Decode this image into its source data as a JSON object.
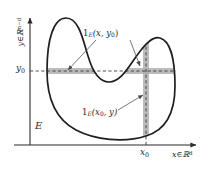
{
  "figure": {
    "domain": "measure-theory-fubini-slices-diagram",
    "background_color": "#ffffff",
    "ink_color": "#2b2b2b",
    "highlight_color": "#9a9a9a",
    "axes": {
      "x_axis_label": "x∈ℝ",
      "x_axis_exponent": "d",
      "y_axis_label": "y∈ℝ",
      "y_axis_exponent": "n−d",
      "origin_x": 30,
      "origin_y": 145
    },
    "ticks": {
      "y0_label": "y",
      "y0_subscript": "0",
      "y0_value_py": 71,
      "x0_label": "x",
      "x0_subscript": "0",
      "x0_value_px": 146
    },
    "region": {
      "set_label": "E",
      "description": "closed blob-shaped region with wavy upper boundary"
    },
    "annotations": [
      {
        "name": "horizontal-slice",
        "indicator": "1",
        "subscript": "E",
        "arguments": "(x, y",
        "arg_subscript": "0",
        "arg_close": ")",
        "text": "1_E(x, y_0)"
      },
      {
        "name": "vertical-slice",
        "indicator": "1",
        "subscript": "E",
        "arguments": "(x",
        "arg_subscript": "0",
        "arg_close": ", y)",
        "text": "1_E(x_0, y)"
      }
    ]
  }
}
